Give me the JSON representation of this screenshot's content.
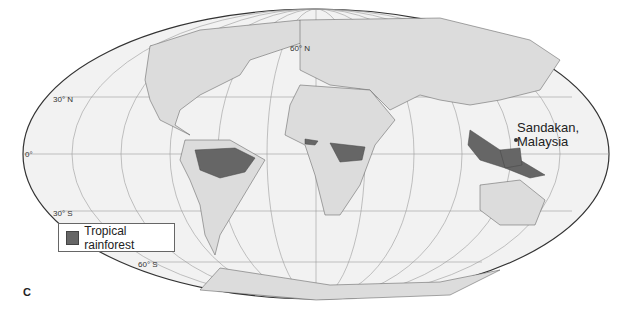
{
  "map": {
    "projection": "Mollweide",
    "colors": {
      "ocean": "#f2f2f2",
      "land": "#dcdcdc",
      "rainforest": "#666666",
      "border": "#555555",
      "graticule": "#9a9a9a"
    },
    "latitude_labels": [
      "60° N",
      "30° N",
      "0°",
      "30° S",
      "60° S"
    ],
    "place_label": [
      "Sandakan,",
      "Malaysia"
    ],
    "legend": [
      {
        "label": "Tropical rainforest",
        "color": "#666666"
      }
    ],
    "panel_label": "C"
  }
}
